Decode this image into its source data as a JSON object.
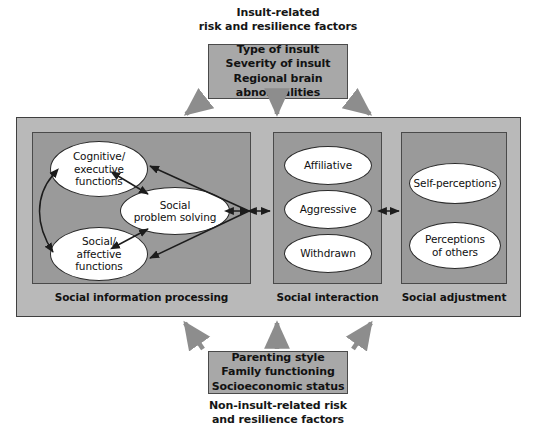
{
  "diagram": {
    "title_top": "Insult-related risk and resilience factors",
    "title_bottom": "Non-insult-related risk and resilience factors"
  },
  "top": {
    "caption_line1": "Insult-related",
    "caption_line2": "risk and resilience factors",
    "box_items": [
      "Type of insult",
      "Severity of insult",
      "Regional brain abnormalities"
    ]
  },
  "bottom": {
    "box_items": [
      "Parenting style",
      "Family functioning",
      "Socioeconomic status"
    ],
    "caption_line1": "Non-insult-related risk",
    "caption_line2": "and resilience factors"
  },
  "panels": [
    {
      "id": "social-information-processing",
      "label": "Social information processing",
      "nodes": [
        {
          "id": "cognitive-executive-functions",
          "lines": [
            "Cognitive/",
            "executive",
            "functions"
          ]
        },
        {
          "id": "social-problem-solving",
          "lines": [
            "Social",
            "problem solving"
          ]
        },
        {
          "id": "social-affective-functions",
          "lines": [
            "Social/",
            "affective",
            "functions"
          ]
        }
      ]
    },
    {
      "id": "social-interaction",
      "label": "Social interaction",
      "nodes": [
        {
          "id": "affiliative",
          "lines": [
            "Affiliative"
          ]
        },
        {
          "id": "aggressive",
          "lines": [
            "Aggressive"
          ]
        },
        {
          "id": "withdrawn",
          "lines": [
            "Withdrawn"
          ]
        }
      ]
    },
    {
      "id": "social-adjustment",
      "label": "Social adjustment",
      "nodes": [
        {
          "id": "self-perceptions",
          "lines": [
            "Self-perceptions"
          ]
        },
        {
          "id": "perceptions-of-others",
          "lines": [
            "Perceptions",
            "of others"
          ]
        }
      ]
    }
  ],
  "colors": {
    "outer_container_fill": "#b9b9b9",
    "panel_fill": "#9a9a9a",
    "factor_box_fill": "#a8a8a8",
    "node_fill": "#ffffff",
    "border_dark": "#3f3f3f",
    "arrow_gray": "#8d8d8d",
    "arrow_black": "#1c1c1c",
    "text": "#121212"
  }
}
